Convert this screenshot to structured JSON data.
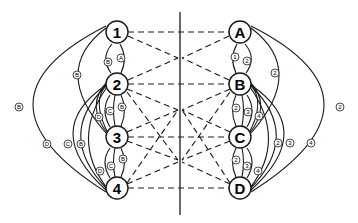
{
  "diagram": {
    "type": "bipartite-network",
    "divider": {
      "x": 180,
      "y1": 12,
      "y2": 215
    },
    "left_nodes": [
      {
        "id": "1",
        "label": "1",
        "x": 117,
        "y": 32
      },
      {
        "id": "2",
        "label": "2",
        "x": 117,
        "y": 84
      },
      {
        "id": "3",
        "label": "3",
        "x": 117,
        "y": 137
      },
      {
        "id": "4",
        "label": "4",
        "x": 117,
        "y": 188
      }
    ],
    "right_nodes": [
      {
        "id": "A",
        "label": "A",
        "x": 240,
        "y": 32
      },
      {
        "id": "B",
        "label": "B",
        "x": 240,
        "y": 84
      },
      {
        "id": "C",
        "label": "C",
        "x": 240,
        "y": 137
      },
      {
        "id": "D",
        "label": "D",
        "x": 240,
        "y": 188
      }
    ],
    "left_arc_labels": [
      {
        "label": "A",
        "x": 121,
        "y": 58
      },
      {
        "label": "B",
        "x": 108,
        "y": 62
      },
      {
        "label": "B",
        "x": 77,
        "y": 75
      },
      {
        "label": "B",
        "x": 19,
        "y": 107
      },
      {
        "label": "B",
        "x": 122,
        "y": 107
      },
      {
        "label": "C",
        "x": 110,
        "y": 111
      },
      {
        "label": "D",
        "x": 99,
        "y": 117
      },
      {
        "label": "D",
        "x": 47,
        "y": 144
      },
      {
        "label": "C",
        "x": 68,
        "y": 144
      },
      {
        "label": "B",
        "x": 81,
        "y": 144
      },
      {
        "label": "B",
        "x": 123,
        "y": 159
      },
      {
        "label": "C",
        "x": 111,
        "y": 166
      },
      {
        "label": "D",
        "x": 100,
        "y": 171
      }
    ],
    "right_arc_labels": [
      {
        "label": "1",
        "x": 235,
        "y": 57
      },
      {
        "label": "2",
        "x": 247,
        "y": 61
      },
      {
        "label": "2",
        "x": 275,
        "y": 73
      },
      {
        "label": "2",
        "x": 340,
        "y": 107
      },
      {
        "label": "2",
        "x": 236,
        "y": 108
      },
      {
        "label": "3",
        "x": 248,
        "y": 112
      },
      {
        "label": "4",
        "x": 259,
        "y": 116
      },
      {
        "label": "2",
        "x": 278,
        "y": 143
      },
      {
        "label": "3",
        "x": 290,
        "y": 143
      },
      {
        "label": "4",
        "x": 311,
        "y": 143
      },
      {
        "label": "2",
        "x": 236,
        "y": 160
      },
      {
        "label": "3",
        "x": 247,
        "y": 166
      },
      {
        "label": "4",
        "x": 258,
        "y": 171
      }
    ]
  }
}
